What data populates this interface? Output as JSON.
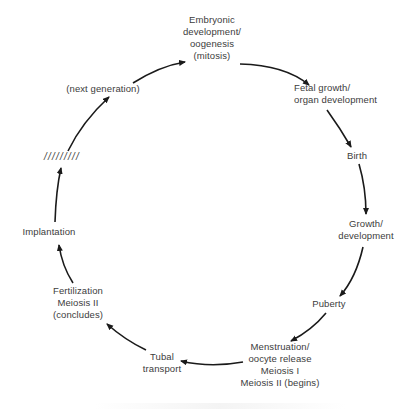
{
  "diagram": {
    "type": "cycle",
    "title": "",
    "stroke_color": "#1a1a1a",
    "text_color": "#3c3c3c",
    "background": "#ffffff",
    "nodes": [
      {
        "id": "embryonic",
        "lines": [
          "Embryonic",
          "development/",
          "oogenesis",
          "(mitosis)"
        ]
      },
      {
        "id": "fetal",
        "lines": [
          "Fetal growth/",
          "organ development"
        ]
      },
      {
        "id": "birth",
        "lines": [
          "Birth"
        ]
      },
      {
        "id": "growth",
        "lines": [
          "Growth/",
          "development"
        ]
      },
      {
        "id": "puberty",
        "lines": [
          "Puberty"
        ]
      },
      {
        "id": "menstruation",
        "lines": [
          "Menstruation/",
          "oocyte release",
          "Meiosis I",
          "Meiosis II (begins)"
        ]
      },
      {
        "id": "tubal",
        "lines": [
          "Tubal",
          "transport"
        ]
      },
      {
        "id": "fertilization",
        "lines": [
          "Fertilization",
          "Meiosis II",
          "(concludes)"
        ]
      },
      {
        "id": "implantation",
        "lines": [
          "Implantation"
        ]
      },
      {
        "id": "break",
        "lines": [
          "/////////"
        ]
      },
      {
        "id": "next",
        "lines": [
          "(next generation)"
        ]
      }
    ],
    "edges": [
      {
        "from": "embryonic",
        "to": "fetal"
      },
      {
        "from": "fetal",
        "to": "birth"
      },
      {
        "from": "birth",
        "to": "growth"
      },
      {
        "from": "growth",
        "to": "puberty"
      },
      {
        "from": "puberty",
        "to": "menstruation"
      },
      {
        "from": "menstruation",
        "to": "tubal"
      },
      {
        "from": "tubal",
        "to": "fertilization"
      },
      {
        "from": "fertilization",
        "to": "implantation"
      },
      {
        "from": "implantation",
        "to": "break"
      },
      {
        "from": "break",
        "to": "next"
      },
      {
        "from": "next",
        "to": "embryonic"
      }
    ]
  }
}
